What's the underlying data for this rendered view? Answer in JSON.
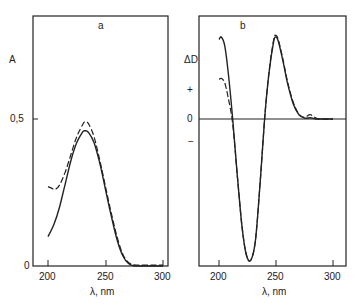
{
  "chart_data": [
    {
      "type": "line",
      "panel_label": "a",
      "title": "",
      "xlabel": "λ, nm",
      "ylabel": "A",
      "xlim": [
        190,
        310
      ],
      "ylim": [
        0,
        0.84
      ],
      "xticks": [
        200,
        250,
        300
      ],
      "yticks": [
        0,
        0.5
      ],
      "ytick_labels": [
        "0",
        "0,5"
      ],
      "grid": false,
      "legend": null,
      "series": [
        {
          "name": "solid",
          "style": "solid",
          "x": [
            200,
            205,
            210,
            215,
            220,
            225,
            230,
            232,
            235,
            240,
            245,
            250,
            255,
            260,
            265,
            270,
            275,
            280,
            290,
            300
          ],
          "y": [
            0.1,
            0.14,
            0.2,
            0.28,
            0.36,
            0.42,
            0.455,
            0.46,
            0.455,
            0.42,
            0.35,
            0.26,
            0.17,
            0.09,
            0.035,
            0.008,
            0.0,
            0.0,
            0.0,
            0.0
          ]
        },
        {
          "name": "dashed",
          "style": "dashed",
          "x": [
            200,
            203,
            206,
            210,
            215,
            220,
            225,
            230,
            232,
            235,
            240,
            245,
            250,
            255,
            260,
            265,
            270,
            275,
            280,
            290,
            300
          ],
          "y": [
            0.27,
            0.265,
            0.26,
            0.275,
            0.32,
            0.38,
            0.44,
            0.48,
            0.49,
            0.485,
            0.44,
            0.36,
            0.27,
            0.18,
            0.1,
            0.04,
            0.012,
            0.004,
            0.003,
            0.003,
            0.003
          ]
        }
      ]
    },
    {
      "type": "line",
      "panel_label": "b",
      "title": "",
      "xlabel": "λ, nm",
      "ylabel": "ΔD",
      "xlim": [
        190,
        315
      ],
      "ylim": [
        -1.4,
        1.03
      ],
      "xticks": [
        200,
        250,
        300
      ],
      "yticks": [
        "+",
        "0",
        "−"
      ],
      "zero_line": true,
      "grid": false,
      "legend": null,
      "series": [
        {
          "name": "solid",
          "style": "solid",
          "x": [
            200,
            202,
            205,
            208,
            212,
            216,
            220,
            224,
            228,
            232,
            236,
            240,
            244,
            248,
            250,
            252,
            256,
            260,
            265,
            270,
            275,
            280,
            285,
            290,
            300
          ],
          "y": [
            0.92,
            0.95,
            0.85,
            0.55,
            0.0,
            -0.55,
            -1.05,
            -1.35,
            -1.4,
            -1.2,
            -0.65,
            0.0,
            0.55,
            0.9,
            0.95,
            0.9,
            0.68,
            0.42,
            0.18,
            0.05,
            0.01,
            0.015,
            0.0,
            0.0,
            0.0
          ]
        },
        {
          "name": "dashed",
          "style": "dashed",
          "x": [
            200,
            202,
            205,
            208,
            212,
            216,
            220,
            224,
            228,
            232,
            236,
            240,
            244,
            248,
            250,
            252,
            256,
            260,
            265,
            270,
            275,
            280,
            285,
            290,
            300
          ],
          "y": [
            0.46,
            0.47,
            0.42,
            0.25,
            -0.05,
            -0.55,
            -1.05,
            -1.35,
            -1.4,
            -1.2,
            -0.65,
            0.0,
            0.56,
            0.92,
            0.97,
            0.92,
            0.7,
            0.44,
            0.2,
            0.06,
            0.02,
            0.05,
            0.01,
            0.0,
            0.0
          ]
        }
      ]
    }
  ],
  "panels": {
    "a": {
      "label": "a",
      "ylabel": "A",
      "xlabel": "λ, nm",
      "yticks": {
        "t05": "0,5",
        "t0": "0"
      },
      "xticks": {
        "t200": "200",
        "t250": "250",
        "t300": "300"
      }
    },
    "b": {
      "label": "b",
      "ylabel": "ΔD",
      "xlabel": "λ, nm",
      "yticks": {
        "plus": "+",
        "zero": "0",
        "minus": "−"
      },
      "xticks": {
        "t200": "200",
        "t250": "250",
        "t300": "300"
      }
    }
  }
}
